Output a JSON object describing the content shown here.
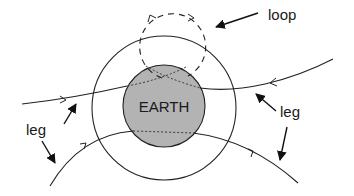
{
  "diagram": {
    "labels": {
      "earth": "EARTH",
      "loop": "loop",
      "leg_left": "leg",
      "leg_right": "leg"
    },
    "colors": {
      "earth_fill": "#b3b3b3",
      "stroke": "#222222",
      "background": "#ffffff"
    }
  }
}
